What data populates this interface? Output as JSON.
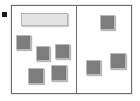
{
  "app": {
    "title": "Two-Pane Tile Sorter",
    "width": 140,
    "height": 101
  },
  "colors": {
    "background": "#ffffff",
    "frame_border": "#6b6b6b",
    "divider": "#6b6b6b",
    "square_fill": "#7d7d7d",
    "square_border": "#b9b9b9",
    "bar_fill": "#e3e3e3",
    "bar_border": "#b4b4b4",
    "bullet": "#1a1a1a"
  },
  "bullet_marker": {
    "label": "bullet-marker",
    "x": 2,
    "y": 12,
    "width": 5,
    "height": 5
  },
  "workspace": {
    "label": "workspace-frame",
    "x": 11,
    "y": 5,
    "width": 121,
    "height": 89,
    "divider_x": 64
  },
  "panes": [
    {
      "id": "left-pane",
      "label": "Left pane",
      "x": 0,
      "width": 64,
      "item_count": 6
    },
    {
      "id": "right-pane",
      "label": "Right pane",
      "x": 65,
      "width": 56,
      "item_count": 3
    }
  ],
  "tiles": [
    {
      "id": "bar-1",
      "name": "bar-tile",
      "pane": "left-pane",
      "shape": "bar",
      "x": 21,
      "y": 13,
      "width": 47,
      "height": 13
    },
    {
      "id": "square-l1",
      "name": "square-tile",
      "pane": "left-pane",
      "shape": "square",
      "x": 16,
      "y": 35,
      "width": 15,
      "height": 15
    },
    {
      "id": "square-l2",
      "name": "square-tile",
      "pane": "left-pane",
      "shape": "square",
      "x": 36,
      "y": 46,
      "width": 14,
      "height": 15
    },
    {
      "id": "square-l3",
      "name": "square-tile",
      "pane": "left-pane",
      "shape": "square",
      "x": 55,
      "y": 44,
      "width": 15,
      "height": 15
    },
    {
      "id": "square-l4",
      "name": "square-tile",
      "pane": "left-pane",
      "shape": "square",
      "x": 28,
      "y": 68,
      "width": 16,
      "height": 16
    },
    {
      "id": "square-l5",
      "name": "square-tile",
      "pane": "left-pane",
      "shape": "square",
      "x": 51,
      "y": 65,
      "width": 16,
      "height": 16
    },
    {
      "id": "square-r1",
      "name": "square-tile",
      "pane": "right-pane",
      "shape": "square",
      "x": 100,
      "y": 15,
      "width": 15,
      "height": 15
    },
    {
      "id": "square-r2",
      "name": "square-tile",
      "pane": "right-pane",
      "shape": "square",
      "x": 86,
      "y": 60,
      "width": 15,
      "height": 15
    },
    {
      "id": "square-r3",
      "name": "square-tile",
      "pane": "right-pane",
      "shape": "square",
      "x": 110,
      "y": 53,
      "width": 16,
      "height": 16
    }
  ]
}
